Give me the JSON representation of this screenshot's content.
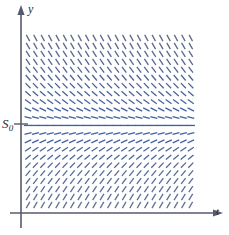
{
  "figure": {
    "kind": "slope-field",
    "title": "",
    "background_color": "#ffffff"
  },
  "axes": {
    "y_axis": {
      "label": "y",
      "color": "#555a6e",
      "x_px": 21,
      "top_px": 14,
      "bottom_px": 228,
      "arrow": "up"
    },
    "t_axis": {
      "label": "t",
      "color": "#555a6e",
      "y_px": 213,
      "left_px": 10,
      "right_px": 214,
      "arrow": "right"
    },
    "tick": {
      "label": "S",
      "subscript": "0",
      "y_px": 124,
      "x_from_px": 14,
      "x_to_px": 28
    }
  },
  "chart_data": {
    "type": "scatter",
    "render": "slope-field",
    "title": "",
    "xlabel": "t",
    "ylabel": "y",
    "annotations": [
      {
        "text": "S",
        "subscript": "0",
        "axis": "y",
        "meaning": "equilibrium-solution-level"
      }
    ],
    "equilibrium_row_index": 11,
    "grid": {
      "columns": 23,
      "rows": 22,
      "x_start_px": 28,
      "x_step_px": 7.4,
      "y_start_px": 38,
      "y_step_px": 7.95
    },
    "mark": {
      "length_px": 7.2,
      "stroke_width": 1.3,
      "color_top": "#5f6a8c",
      "color_equilibrium": "#3f5fa0",
      "color_bottom": "#6a7391"
    },
    "slope_model": {
      "description": "Slope depends only on y: zero at S0, increasingly negative above S0, increasingly positive below S0; magnitude saturates toward the top and bottom of the field.",
      "angles_deg_by_row_top_to_bottom": [
        -62,
        -60,
        -58,
        -56,
        -53,
        -50,
        -46,
        -41,
        -35,
        -27,
        -16,
        0,
        14,
        25,
        34,
        41,
        46,
        50,
        53,
        56,
        58,
        60
      ]
    },
    "xlim": [
      0,
      23
    ],
    "ylim": [
      0,
      22
    ],
    "legend": null,
    "gridlines": false
  }
}
